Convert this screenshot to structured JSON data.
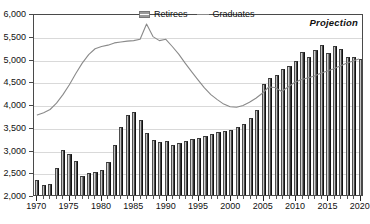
{
  "chart_data": {
    "type": "bar",
    "title": "",
    "xlabel": "",
    "ylabel": "",
    "ylim": [
      2000,
      6000
    ],
    "xlim": [
      1970,
      2020
    ],
    "ytick_labels": [
      "6,000",
      "5,500",
      "5,000",
      "4,500",
      "4,000",
      "3,500",
      "3,000",
      "2,500",
      "2,000"
    ],
    "ytick_values": [
      6000,
      5500,
      5000,
      4500,
      4000,
      3500,
      3000,
      2500,
      2000
    ],
    "xtick_labels": [
      "1970",
      "1975",
      "1980",
      "1985",
      "1990",
      "1995",
      "2000",
      "2005",
      "2010",
      "2015",
      "2020"
    ],
    "xtick_values": [
      1970,
      1975,
      1980,
      1985,
      1990,
      1995,
      2000,
      2005,
      2010,
      2015,
      2020
    ],
    "grid": true,
    "legend_position": "top-center",
    "annotations": [
      {
        "text": "Projection",
        "x": 2014,
        "style": "bold-italic"
      }
    ],
    "x": [
      1970,
      1971,
      1972,
      1973,
      1974,
      1975,
      1976,
      1977,
      1978,
      1979,
      1980,
      1981,
      1982,
      1983,
      1984,
      1985,
      1986,
      1987,
      1988,
      1989,
      1990,
      1991,
      1992,
      1993,
      1994,
      1995,
      1996,
      1997,
      1998,
      1999,
      2000,
      2001,
      2002,
      2003,
      2004,
      2005,
      2006,
      2007,
      2008,
      2009,
      2010,
      2011,
      2012,
      2013,
      2014,
      2015,
      2016,
      2017,
      2018,
      2019,
      2020
    ],
    "series": [
      {
        "name": "Retirees",
        "type": "bar",
        "values": [
          2340,
          2210,
          2250,
          2600,
          2980,
          2900,
          2740,
          2420,
          2480,
          2500,
          2540,
          2730,
          3090,
          3490,
          3760,
          3820,
          3640,
          3360,
          3200,
          3160,
          3180,
          3100,
          3140,
          3190,
          3240,
          3260,
          3300,
          3350,
          3380,
          3400,
          3420,
          3500,
          3560,
          3700,
          3860,
          4430,
          4580,
          4630,
          4780,
          4840,
          4950,
          5140,
          5040,
          5180,
          5300,
          5130,
          5280,
          5220,
          5040,
          5030,
          5000
        ]
      },
      {
        "name": "Graduates",
        "type": "line",
        "values": [
          3780,
          3830,
          3900,
          4040,
          4230,
          4450,
          4700,
          4930,
          5120,
          5250,
          5300,
          5330,
          5380,
          5400,
          5420,
          5430,
          5460,
          5800,
          5520,
          5430,
          5460,
          5300,
          5130,
          4930,
          4740,
          4560,
          4380,
          4230,
          4120,
          4020,
          3960,
          3950,
          3990,
          4060,
          4150,
          4260,
          4400,
          4390,
          4300,
          4400,
          4500,
          4560,
          4600,
          4640,
          4700,
          4750,
          4800,
          4860,
          4920,
          4970,
          5020
        ]
      }
    ]
  },
  "legend": {
    "items": [
      {
        "label": "Retirees",
        "marker": "bar-swatch"
      },
      {
        "label": "Graduates",
        "marker": "line-swatch"
      }
    ]
  },
  "colors": {
    "bar_dark": "#2b2b2b",
    "bar_light": "#f2f2f2",
    "line": "#8a8a8a",
    "grid": "#d9d9d9",
    "axis": "#4a4a4a",
    "text": "#111111"
  }
}
